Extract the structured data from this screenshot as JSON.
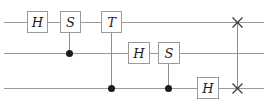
{
  "figure": {
    "kind": "quantum-circuit-diagram",
    "width": 268,
    "height": 108,
    "background_color": "#ffffff",
    "wire_color": "#9a9a9a",
    "gate_border_color": "#9a9a9a",
    "gate_label_color": "#1c1c1c",
    "control_dot_color": "#1c1c1c",
    "num_wires": 3
  },
  "wires": [
    {
      "index": 0,
      "name": "qubit-wire-1",
      "y": 22,
      "x_start": 4,
      "x_end": 264
    },
    {
      "index": 1,
      "name": "qubit-wire-2",
      "y": 53,
      "x_start": 4,
      "x_end": 264
    },
    {
      "index": 2,
      "name": "qubit-wire-3",
      "y": 88,
      "x_start": 4,
      "x_end": 264
    }
  ],
  "gates": [
    {
      "id": "g1",
      "label": "H",
      "wire": 0,
      "x": 27,
      "y": 11,
      "w": 21,
      "h": 22
    },
    {
      "id": "g2",
      "label": "S",
      "wire": 0,
      "x": 60,
      "y": 11,
      "w": 21,
      "h": 22
    },
    {
      "id": "g3",
      "label": "T",
      "wire": 0,
      "x": 101,
      "y": 11,
      "w": 21,
      "h": 22
    },
    {
      "id": "g4",
      "label": "H",
      "wire": 1,
      "x": 128,
      "y": 42,
      "w": 22,
      "h": 22
    },
    {
      "id": "g5",
      "label": "S",
      "wire": 1,
      "x": 158,
      "y": 42,
      "w": 22,
      "h": 22
    },
    {
      "id": "g6",
      "label": "H",
      "wire": 2,
      "x": 197,
      "y": 77,
      "w": 22,
      "h": 22
    }
  ],
  "controls": [
    {
      "id": "c1",
      "for_gate": "g2",
      "x": 69,
      "y": 53,
      "from_y": 33,
      "to_y": 53
    },
    {
      "id": "c2",
      "for_gate": "g3",
      "x": 111,
      "y": 88,
      "from_y": 33,
      "to_y": 88
    },
    {
      "id": "c3",
      "for_gate": "g5",
      "x": 168,
      "y": 88,
      "from_y": 64,
      "to_y": 88
    }
  ],
  "swap": {
    "id": "sw1",
    "name": "swap-gate",
    "x": 237,
    "top_y": 22,
    "bottom_y": 88,
    "marks": [
      {
        "id": "swx-top",
        "x": 237,
        "y": 22
      },
      {
        "id": "swx-bottom",
        "x": 237,
        "y": 88
      }
    ]
  }
}
